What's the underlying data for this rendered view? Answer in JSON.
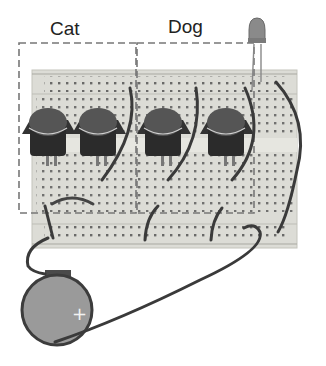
{
  "diagram": {
    "type": "breadboard-circuit",
    "groups": [
      {
        "label": "Cat",
        "buttons": 2
      },
      {
        "label": "Dog",
        "buttons": 2
      }
    ],
    "components": [
      "breadboard",
      "push-button",
      "push-button",
      "push-button",
      "push-button",
      "led",
      "coin-cell-battery",
      "jumper-wires"
    ],
    "battery": {
      "polarity_mark": "+"
    }
  },
  "colors": {
    "breadboard": "#dcdcd6",
    "breadboard_edge": "#bdbdb6",
    "hole": "#555555",
    "button_cap": "#555555",
    "button_body": "#2b2b2b",
    "wire": "#3a3a3a",
    "battery": "#9a9a9a",
    "dashed_box": "#777777",
    "led": "#8a8a8a"
  }
}
